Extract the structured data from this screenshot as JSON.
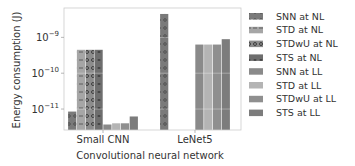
{
  "chart_data": {
    "type": "bar",
    "title": "",
    "xlabel": "Convolutional neural network",
    "ylabel": "Energy consumption (J)",
    "yscale": "log",
    "ylim": [
      2.6e-12,
      6.6e-09
    ],
    "yticks": [
      {
        "value": 1e-09,
        "label_base": "10",
        "label_exp": "−9"
      },
      {
        "value": 1e-10,
        "label_base": "10",
        "label_exp": "−10"
      },
      {
        "value": 1e-11,
        "label_base": "10",
        "label_exp": "−11"
      }
    ],
    "grid": true,
    "legend_position": "right",
    "categories": [
      "Small CNN",
      "LeNet5"
    ],
    "series": [
      {
        "name": "SNN at NL",
        "color": "#7a7a7a",
        "hatch": "dots",
        "values": [
          8.5e-12,
          4.5e-09
        ]
      },
      {
        "name": "STD at NL",
        "color": "#a6a6a6",
        "hatch": "dash",
        "values": [
          4.5e-10,
          null
        ]
      },
      {
        "name": "STDwU at NL",
        "color": "#8c8c8c",
        "hatch": "ring",
        "values": [
          4.5e-10,
          null
        ]
      },
      {
        "name": "STS at NL",
        "color": "#6e6e6e",
        "hatch": "star",
        "values": [
          4.5e-10,
          null
        ]
      },
      {
        "name": "SNN at LL",
        "color": "#8a8a8a",
        "hatch": "none",
        "values": [
          3.7e-12,
          6.3e-10
        ]
      },
      {
        "name": "STD at LL",
        "color": "#b4b4b4",
        "hatch": "none",
        "values": [
          4e-12,
          6.3e-10
        ]
      },
      {
        "name": "STDwU at LL",
        "color": "#8f8f8f",
        "hatch": "none",
        "values": [
          4e-12,
          6.3e-10
        ]
      },
      {
        "name": "STS at LL",
        "color": "#7c7c7c",
        "hatch": "none",
        "values": [
          6.2e-12,
          8.9e-10
        ]
      }
    ]
  }
}
